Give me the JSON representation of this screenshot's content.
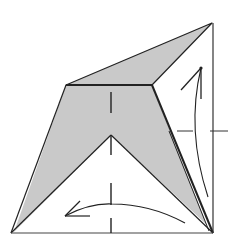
{
  "diagram": {
    "type": "origami-fold-diagram",
    "colors": {
      "paper_fill": "#c9c9c9",
      "line": "#222222",
      "background": "#ffffff"
    },
    "shapes": {
      "outer_square_edges": [
        [
          11,
          233
        ],
        [
          213,
          233
        ],
        [
          213,
          23
        ]
      ],
      "top_flap": [
        [
          66,
          85
        ],
        [
          212,
          23
        ],
        [
          152,
          85
        ]
      ],
      "kite_body": [
        [
          66,
          85
        ],
        [
          152,
          85
        ],
        [
          213,
          233
        ],
        [
          111,
          135
        ],
        [
          11,
          233
        ]
      ],
      "inner_triangle": [
        [
          11,
          233
        ],
        [
          111,
          135
        ],
        [
          213,
          233
        ]
      ],
      "center_crease_x": 111,
      "center_crease_dashes": [
        [
          92,
          113
        ],
        [
          133,
          155
        ],
        [
          183,
          205
        ],
        [
          218,
          233
        ]
      ],
      "right_reference_ticks_y": 131
    },
    "arrows": [
      {
        "name": "fold-up-arrow",
        "direction": "up",
        "tip": [
          201,
          68
        ],
        "tail": [
          208,
          197
        ]
      },
      {
        "name": "unfold-left-arrow",
        "direction": "left",
        "tip": [
          65,
          216
        ],
        "tail": [
          185,
          223
        ]
      }
    ]
  }
}
